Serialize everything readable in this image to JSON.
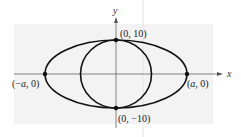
{
  "diagram": {
    "type": "conic-sections",
    "axes": {
      "x_label": "x",
      "y_label": "y"
    },
    "shapes": [
      {
        "kind": "ellipse",
        "description": "horizontal ellipse through (±a, 0) and (0, ±10)"
      },
      {
        "kind": "circle",
        "description": "circle through (0, 10) and (0, -10)"
      }
    ],
    "points": [
      {
        "id": "top",
        "label": "(0, 10)"
      },
      {
        "id": "bottom",
        "label": "(0, −10)"
      },
      {
        "id": "left",
        "label_prefix": "(−",
        "label_var": "a",
        "label_suffix": ", 0)"
      },
      {
        "id": "right",
        "label_prefix": "(",
        "label_var": "a",
        "label_suffix": ", 0)"
      }
    ]
  },
  "colors": {
    "background_panel": "#f3f3f3",
    "curve": "#111111",
    "axis": "#555555",
    "guide_line": "#e4e4e4"
  }
}
